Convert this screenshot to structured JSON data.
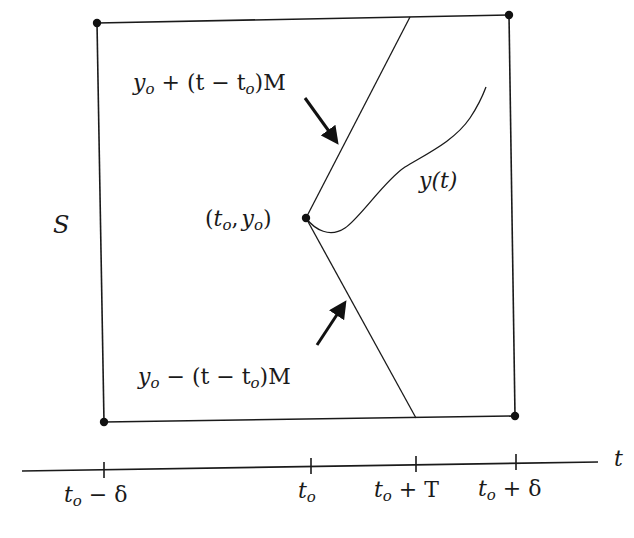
{
  "diagram": {
    "region_label": "S",
    "center_point_label": "(t_o, y_o)",
    "center_point_text": {
      "open": "(",
      "t": "t",
      "sub1": "o",
      "comma": ",",
      "y": "y",
      "sub2": "o",
      "close": ")"
    },
    "upper_bound_label": {
      "y": "y",
      "sub1": "o",
      "mid": " + (t − t",
      "sub2": "o",
      "end": ")M"
    },
    "lower_bound_label": {
      "y": "y",
      "sub1": "o",
      "mid": " − (t − t",
      "sub2": "o",
      "end": ")M"
    },
    "curve_label": "y(t)",
    "axis": {
      "label": "t",
      "ticks": [
        {
          "main": "t",
          "sub": "o",
          "rest": " − δ"
        },
        {
          "main": "t",
          "sub": "o",
          "rest": ""
        },
        {
          "main": "t",
          "sub": "o",
          "rest": " + T"
        },
        {
          "main": "t",
          "sub": "o",
          "rest": " + δ"
        }
      ]
    },
    "colors": {
      "ink": "#1a1a1a",
      "background": "#ffffff"
    }
  }
}
